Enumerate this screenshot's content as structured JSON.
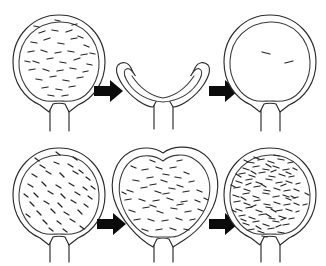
{
  "figure": {
    "background_color": "#ffffff",
    "line_color": "#2b2b2b",
    "arrow_color": "#0b0b0b",
    "width": 326,
    "height": 266,
    "rows": 2,
    "columns": 3
  },
  "panels": [
    {
      "id": "row1-panel1",
      "row": 1,
      "column": 1,
      "shape": "round-full-bladder",
      "state_label": "full-rounded",
      "content_density": "moderate",
      "mark_count": 38,
      "center_x": 59,
      "center_y": 63,
      "radius_x": 46,
      "radius_y": 48,
      "has_stem": true,
      "stem_length": 38
    },
    {
      "id": "row1-panel2",
      "row": 1,
      "column": 2,
      "shape": "collapsed-crescent-bladder",
      "state_label": "emptied-collapsed",
      "content_density": "none",
      "mark_count": 0,
      "center_x": 163,
      "center_y": 84,
      "radius_x": 48,
      "radius_y": 20,
      "has_stem": true,
      "stem_length": 34
    },
    {
      "id": "row1-panel3",
      "row": 1,
      "column": 3,
      "shape": "round-refilled-bladder",
      "state_label": "refilled-sparse",
      "content_density": "sparse",
      "mark_count": 2,
      "center_x": 270,
      "center_y": 63,
      "radius_x": 46,
      "radius_y": 48,
      "has_stem": true,
      "stem_length": 38
    },
    {
      "id": "row2-panel1",
      "row": 2,
      "column": 1,
      "shape": "round-full-bladder",
      "state_label": "filled-regrown",
      "content_density": "moderate",
      "mark_count": 40,
      "center_x": 59,
      "center_y": 196,
      "radius_x": 46,
      "radius_y": 48,
      "has_stem": true,
      "stem_length": 38
    },
    {
      "id": "row2-panel2",
      "row": 2,
      "column": 2,
      "shape": "heart-shaped-bladder",
      "state_label": "distended-heart-shape",
      "content_density": "moderate-high",
      "mark_count": 48,
      "center_x": 163,
      "center_y": 196,
      "radius_x": 52,
      "radius_y": 52,
      "has_stem": true,
      "stem_length": 38
    },
    {
      "id": "row2-panel3",
      "row": 2,
      "column": 3,
      "shape": "round-packed-bladder",
      "state_label": "densely-packed",
      "content_density": "dense",
      "mark_count": 120,
      "center_x": 270,
      "center_y": 196,
      "radius_x": 46,
      "radius_y": 48,
      "has_stem": true,
      "stem_length": 38
    }
  ],
  "arrows": [
    {
      "id": "arrow-row1-1",
      "row": 1,
      "from_panel": "row1-panel1",
      "to_panel": "row1-panel2",
      "x": 94,
      "y": 91,
      "direction": "right"
    },
    {
      "id": "arrow-row1-2",
      "row": 1,
      "from_panel": "row1-panel2",
      "to_panel": "row1-panel3",
      "x": 209,
      "y": 91,
      "direction": "right"
    },
    {
      "id": "arrow-row2-1",
      "row": 2,
      "from_panel": "row2-panel1",
      "to_panel": "row2-panel2",
      "x": 97,
      "y": 224,
      "direction": "right"
    },
    {
      "id": "arrow-row2-2",
      "row": 2,
      "from_panel": "row2-panel2",
      "to_panel": "row2-panel3",
      "x": 209,
      "y": 224,
      "direction": "right"
    }
  ]
}
